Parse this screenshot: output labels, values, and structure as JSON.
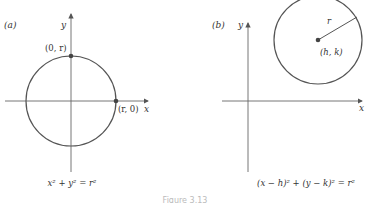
{
  "figure": {
    "caption": "Figure 3.13",
    "colors": {
      "stroke": "#555555",
      "axis": "#666666",
      "text": "#333333",
      "point": "#444444"
    }
  },
  "panels": [
    {
      "id": "a",
      "panel_label": "(a)",
      "y_axis_label": "y",
      "x_axis_label": "x",
      "points": [
        {
          "label": "(0, r)"
        },
        {
          "label": "(r, 0)"
        }
      ],
      "equation": "x² + y² = r²"
    },
    {
      "id": "b",
      "panel_label": "(b)",
      "y_axis_label": "y",
      "x_axis_label": "x",
      "radius_label": "r",
      "points": [
        {
          "label": "(h, k)"
        }
      ],
      "equation": "(x − h)² + (y − k)² = r²"
    }
  ]
}
